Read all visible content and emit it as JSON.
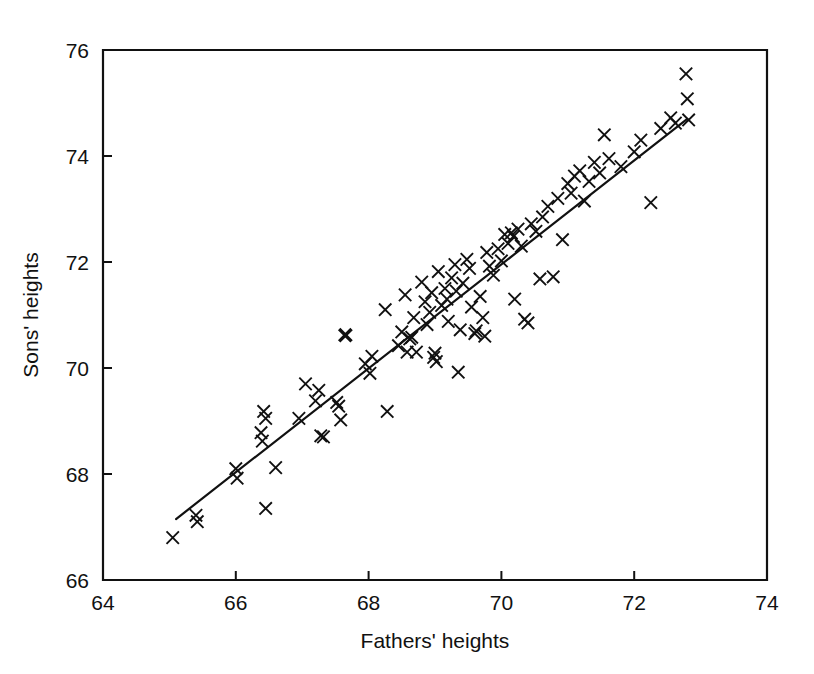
{
  "chart_data": {
    "type": "scatter",
    "title": "",
    "xlabel": "Fathers' heights",
    "ylabel": "Sons' heights",
    "xlim": [
      64,
      74
    ],
    "ylim": [
      66,
      76
    ],
    "xticks": [
      64,
      66,
      68,
      70,
      72,
      74
    ],
    "yticks": [
      66,
      68,
      70,
      72,
      74,
      76
    ],
    "xtick_labels": [
      "64",
      "66",
      "68",
      "70",
      "72",
      "74"
    ],
    "ytick_labels": [
      "66",
      "68",
      "70",
      "72",
      "74",
      "76"
    ],
    "grid": false,
    "legend": null,
    "marker": "x",
    "marker_color": "#111111",
    "fit_line": {
      "type": "linear-regression",
      "x_start": 65.1,
      "y_start": 67.15,
      "x_end": 72.8,
      "y_end": 74.7,
      "color": "#111111"
    },
    "points": [
      [
        65.05,
        66.8
      ],
      [
        65.4,
        67.22
      ],
      [
        65.42,
        67.1
      ],
      [
        66.0,
        68.1
      ],
      [
        66.02,
        67.92
      ],
      [
        66.38,
        68.78
      ],
      [
        66.4,
        68.62
      ],
      [
        66.42,
        69.18
      ],
      [
        66.45,
        69.05
      ],
      [
        66.45,
        67.35
      ],
      [
        66.6,
        68.12
      ],
      [
        66.95,
        69.05
      ],
      [
        67.05,
        69.7
      ],
      [
        67.2,
        69.38
      ],
      [
        67.25,
        69.58
      ],
      [
        67.28,
        68.72
      ],
      [
        67.32,
        68.7
      ],
      [
        67.52,
        69.35
      ],
      [
        67.55,
        69.28
      ],
      [
        67.58,
        69.02
      ],
      [
        67.65,
        70.62
      ],
      [
        67.95,
        70.08
      ],
      [
        68.02,
        69.9
      ],
      [
        68.05,
        70.22
      ],
      [
        68.25,
        71.1
      ],
      [
        68.28,
        69.18
      ],
      [
        68.45,
        70.42
      ],
      [
        68.5,
        70.68
      ],
      [
        68.55,
        71.38
      ],
      [
        68.58,
        70.3
      ],
      [
        68.62,
        70.55
      ],
      [
        68.65,
        70.58
      ],
      [
        68.68,
        70.95
      ],
      [
        68.72,
        70.3
      ],
      [
        68.8,
        71.62
      ],
      [
        68.85,
        71.25
      ],
      [
        68.88,
        70.82
      ],
      [
        68.92,
        71.05
      ],
      [
        68.95,
        71.42
      ],
      [
        68.98,
        70.2
      ],
      [
        69.0,
        70.28
      ],
      [
        69.02,
        70.12
      ],
      [
        69.05,
        71.82
      ],
      [
        69.1,
        71.18
      ],
      [
        69.15,
        71.5
      ],
      [
        69.18,
        71.3
      ],
      [
        69.2,
        70.88
      ],
      [
        69.25,
        71.7
      ],
      [
        69.3,
        71.95
      ],
      [
        69.32,
        71.45
      ],
      [
        69.35,
        69.92
      ],
      [
        69.38,
        70.72
      ],
      [
        69.42,
        71.6
      ],
      [
        69.48,
        72.05
      ],
      [
        69.52,
        71.88
      ],
      [
        69.55,
        71.15
      ],
      [
        69.6,
        70.65
      ],
      [
        69.62,
        70.7
      ],
      [
        69.68,
        71.35
      ],
      [
        69.72,
        70.95
      ],
      [
        69.75,
        70.6
      ],
      [
        69.78,
        72.18
      ],
      [
        69.82,
        71.92
      ],
      [
        69.88,
        71.75
      ],
      [
        69.95,
        72.25
      ],
      [
        70.0,
        72.02
      ],
      [
        70.05,
        72.52
      ],
      [
        70.1,
        72.35
      ],
      [
        70.15,
        72.55
      ],
      [
        70.18,
        72.48
      ],
      [
        70.2,
        71.3
      ],
      [
        70.25,
        72.62
      ],
      [
        70.3,
        72.3
      ],
      [
        70.35,
        70.92
      ],
      [
        70.4,
        70.85
      ],
      [
        70.45,
        72.72
      ],
      [
        70.52,
        72.58
      ],
      [
        70.58,
        71.68
      ],
      [
        70.62,
        72.85
      ],
      [
        70.7,
        73.05
      ],
      [
        70.78,
        71.72
      ],
      [
        70.85,
        73.2
      ],
      [
        70.92,
        72.42
      ],
      [
        71.0,
        73.48
      ],
      [
        71.05,
        73.3
      ],
      [
        71.1,
        73.62
      ],
      [
        71.18,
        73.72
      ],
      [
        71.25,
        73.15
      ],
      [
        71.32,
        73.52
      ],
      [
        71.4,
        73.88
      ],
      [
        71.48,
        73.68
      ],
      [
        71.55,
        74.4
      ],
      [
        71.62,
        73.95
      ],
      [
        71.8,
        73.8
      ],
      [
        72.0,
        74.08
      ],
      [
        72.1,
        74.3
      ],
      [
        72.25,
        73.12
      ],
      [
        72.4,
        74.52
      ],
      [
        72.55,
        74.72
      ],
      [
        72.62,
        74.62
      ],
      [
        72.78,
        75.55
      ],
      [
        72.8,
        75.08
      ],
      [
        72.82,
        74.68
      ]
    ],
    "bold_points": [
      [
        67.65,
        70.62
      ]
    ]
  }
}
